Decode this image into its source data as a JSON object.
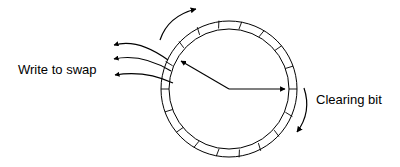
{
  "diagram": {
    "type": "clock-page-replacement-algorithm",
    "background_color": "#ffffff",
    "stroke_color": "#000000",
    "canvas": {
      "width": 400,
      "height": 167
    },
    "ring": {
      "name": "page-frame-ring",
      "center_x": 229,
      "center_y": 89,
      "outer_radius": 68,
      "inner_radius": 60,
      "segment_count": 18,
      "segment_angle_degrees": 20
    },
    "hands": [
      {
        "name": "clearing-bit-hand",
        "angle_degrees": 0,
        "direction": "right",
        "length": 60,
        "arrowhead": true
      },
      {
        "name": "write-to-swap-hand",
        "angle_degrees": 150,
        "direction": "up-left",
        "length": 60,
        "arrowhead": true
      }
    ],
    "rotation_arrows": [
      {
        "name": "top-rotation-arrow",
        "position": "top-left-outside",
        "direction": "clockwise"
      },
      {
        "name": "right-rotation-arrow",
        "position": "right-outside",
        "direction": "clockwise"
      }
    ],
    "eviction_arrows": {
      "name": "write-to-swap-arrows",
      "count": 3,
      "direction": "outward-left"
    },
    "labels": {
      "write_to_swap": "Write to swap",
      "clearing_bit": "Clearing bit"
    },
    "label_positions": {
      "write_to_swap": {
        "x": 18,
        "y": 71
      },
      "clearing_bit": {
        "x": 316,
        "y": 101
      }
    }
  }
}
